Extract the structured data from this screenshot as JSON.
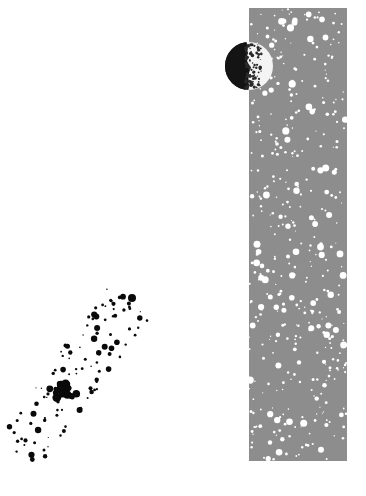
{
  "scene": {
    "title": "Abstract space illustration",
    "background_color": "#ffffff",
    "elements": [
      {
        "name": "speckled-gray-column",
        "description": "tall gray vertical band with white speckles (starfield)",
        "color": "#8d8d8d",
        "speckle_color": "#ffffff"
      },
      {
        "name": "half-moon",
        "description": "moon with dark left half and lit textured right half",
        "dark_color": "#141414",
        "lit_color": "#f4f4f4",
        "texture_color": "#2a2a2a"
      },
      {
        "name": "black-dot-cluster",
        "description": "scattered cluster of black ink dots, dense center, trailing up-right",
        "color": "#0a0a0a"
      }
    ]
  }
}
